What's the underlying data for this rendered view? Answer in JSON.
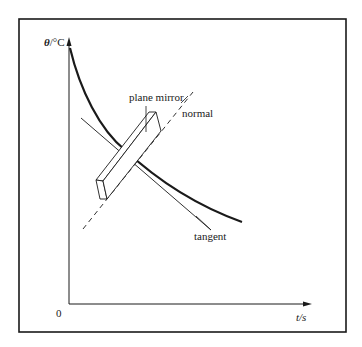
{
  "diagram": {
    "labels": {
      "y_axis": "θ/°C",
      "x_axis": "t/s",
      "origin": "0",
      "mirror": "plane mirror",
      "normal": "normal",
      "tangent": "tangent"
    },
    "elements": [
      {
        "name": "frame",
        "type": "rectangle"
      },
      {
        "name": "y-axis",
        "type": "arrow",
        "label": "θ/°C"
      },
      {
        "name": "x-axis",
        "type": "arrow",
        "label": "t/s"
      },
      {
        "name": "cooling-curve",
        "type": "curve",
        "description": "decreasing, concave up"
      },
      {
        "name": "plane-mirror",
        "type": "block"
      },
      {
        "name": "normal-line",
        "type": "dashed line"
      },
      {
        "name": "tangent-line",
        "type": "line"
      }
    ],
    "colors": {
      "stroke": "#1a1a1a",
      "background": "#ffffff"
    }
  }
}
